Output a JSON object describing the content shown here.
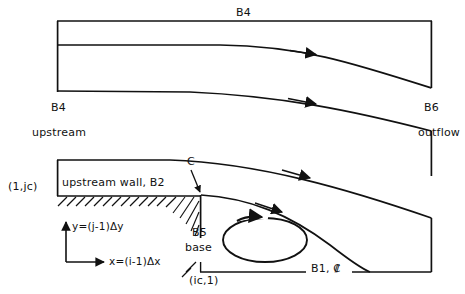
{
  "figure": {
    "type": "flow-domain-schematic"
  },
  "labels": {
    "top_wall": "B4",
    "inlet_top": "B4",
    "inlet_sub": "upstream",
    "outflow_top": "B6",
    "outflow_sub": "outflow",
    "corner_node": "(1,jc)",
    "upstream_wall": "upstream wall, B2",
    "corner_point": "C",
    "step_base_top": "B5",
    "step_base_bottom": "base",
    "base_node": "(ic,1)",
    "centerline": "B1, ₡",
    "y_axis": "y=(j-1)Δy",
    "x_axis": "x=(i-1)Δx"
  },
  "colors": {
    "ink": "#111111",
    "background": "#ffffff"
  },
  "geometry": {
    "inlet_x": 57,
    "outlet_x": 432,
    "top_wall_y": 21,
    "centerline_y": 272,
    "step_x": 200,
    "step_wall_y": 195,
    "inlet_lower_y": 160
  }
}
